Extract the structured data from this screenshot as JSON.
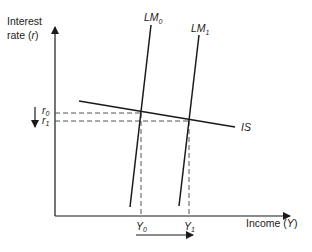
{
  "diagram": {
    "y_axis": {
      "label_line1": "Interest",
      "label_line2": "rate (",
      "label_var": "r",
      "label_close": ")"
    },
    "x_axis": {
      "label": "Income (",
      "label_var": "Y",
      "label_close": ")"
    },
    "curves": {
      "lm0": {
        "name": "LM",
        "sub": "0"
      },
      "lm1": {
        "name": "LM",
        "sub": "1"
      },
      "is": {
        "name": "IS"
      }
    },
    "levels": {
      "r0": {
        "name": "r",
        "sub": "0"
      },
      "r1": {
        "name": "r",
        "sub": "1"
      },
      "y0": {
        "name": "Y",
        "sub": "0"
      },
      "y1": {
        "name": "Y",
        "sub": "1"
      }
    },
    "annotations": {
      "interest_rate_arrow": "down",
      "income_arrow": "right"
    },
    "colors": {
      "line": "#1a1a1a",
      "dash": "#555555",
      "background": "#ffffff"
    }
  }
}
